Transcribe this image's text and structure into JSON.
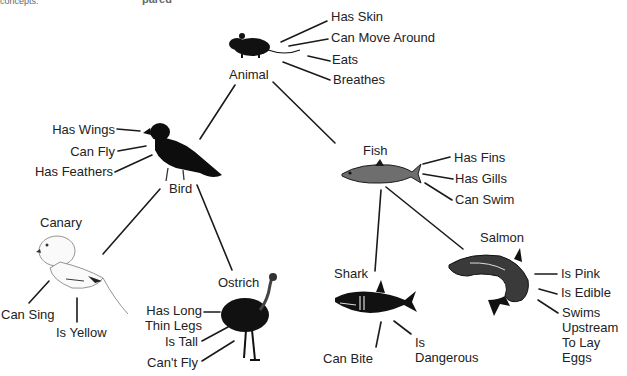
{
  "header": {
    "left_caption": "concepts.",
    "center_caption": "pared"
  },
  "nodes": {
    "animal": {
      "label": "Animal",
      "properties": [
        "Has Skin",
        "Can Move Around",
        "Eats",
        "Breathes"
      ]
    },
    "bird": {
      "label": "Bird",
      "properties": [
        "Has Wings",
        "Can Fly",
        "Has Feathers"
      ]
    },
    "fish": {
      "label": "Fish",
      "properties": [
        "Has Fins",
        "Has Gills",
        "Can Swim"
      ]
    },
    "canary": {
      "label": "Canary",
      "properties": [
        "Can Sing",
        "Is Yellow"
      ]
    },
    "ostrich": {
      "label": "Ostrich",
      "properties": [
        "Has Long\nThin Legs",
        "Is Tall",
        "Can't Fly"
      ]
    },
    "shark": {
      "label": "Shark",
      "properties": [
        "Can Bite",
        "Is\nDangerous"
      ]
    },
    "salmon": {
      "label": "Salmon",
      "properties": [
        "Is Pink",
        "Is Edible",
        "Swims\nUpstream\nTo Lay\nEggs"
      ]
    }
  },
  "edges": [
    [
      "Animal",
      "Bird"
    ],
    [
      "Animal",
      "Fish"
    ],
    [
      "Bird",
      "Canary"
    ],
    [
      "Bird",
      "Ostrich"
    ],
    [
      "Fish",
      "Shark"
    ],
    [
      "Fish",
      "Salmon"
    ]
  ],
  "colors": {
    "ink": "#1a1a1a",
    "background": "#ffffff"
  }
}
